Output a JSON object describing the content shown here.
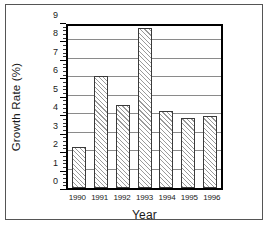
{
  "chart_data": {
    "type": "bar",
    "title": "",
    "xlabel": "Year",
    "ylabel": "Growth Rate (%)",
    "categories": [
      "1990",
      "1991",
      "1992",
      "1993",
      "1994",
      "1995",
      "1996"
    ],
    "values": [
      2.2,
      6.1,
      4.5,
      8.7,
      4.2,
      3.8,
      3.9
    ],
    "ylim": [
      0,
      9
    ],
    "ytick_labels": [
      "0",
      "1",
      "2",
      "3",
      "4",
      "5",
      "6",
      "7",
      "8",
      "9"
    ],
    "ytick_values": [
      0,
      1,
      2,
      3,
      4,
      5,
      6,
      7,
      8,
      9
    ],
    "yminor_tick_interval": 0.2,
    "grid": "horizontal",
    "legend": "none",
    "bar_fill": "diagonal-hatch",
    "bar_fill_color": "#9a9a9a",
    "bar_edge_color": "#3a3a3a",
    "axis_color": "#000000",
    "gridline_color": "#8a8a8a",
    "background_color": "#ffffff"
  },
  "figure": {
    "border_color": "#555555"
  }
}
